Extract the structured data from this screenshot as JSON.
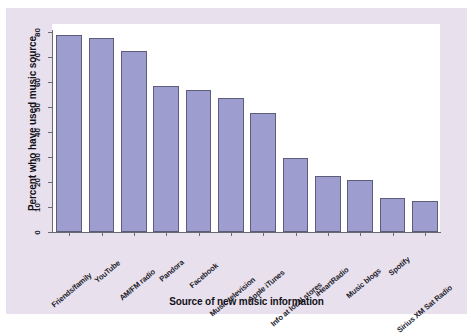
{
  "chart_data": {
    "type": "bar",
    "title": "",
    "subtitle": "",
    "xlabel": "Source of new music information",
    "ylabel": "Percent who have used music source",
    "categories": [
      "Friends/family",
      "YouTube",
      "AM/FM radio",
      "Pandora",
      "Facebook",
      "Music television",
      "Apple iTunes",
      "Info at local stores",
      "iHeartRadio",
      "Music blogs",
      "Spotify",
      "Sirius XM Sat Radio"
    ],
    "values": [
      79,
      77.5,
      72.5,
      58.5,
      57,
      53.5,
      47.5,
      29.5,
      22.5,
      21,
      13.5,
      12.5
    ],
    "ylim": [
      0,
      80
    ],
    "yticks": [
      0,
      10,
      20,
      30,
      40,
      50,
      60,
      70,
      80
    ],
    "ytick_labels": [
      "0",
      "10",
      "20",
      "30",
      "40",
      "50",
      "60",
      "70",
      "80"
    ],
    "grid": false,
    "legend": false,
    "legend_position": "none",
    "bar_color": "#9d9dcf",
    "bar_edge_color": "#5d5d7a",
    "plot_background": "#ffffff",
    "figure_background": "#e9e0ed"
  }
}
